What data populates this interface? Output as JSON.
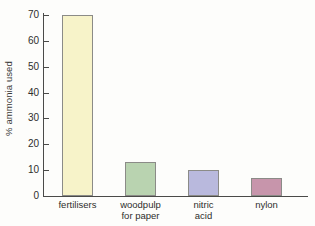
{
  "chart_data": {
    "type": "bar",
    "title": "",
    "xlabel": "",
    "ylabel": "% ammonia used",
    "categories": [
      "fertilisers",
      "woodpulp\nfor paper",
      "nitric\nacid",
      "nylon"
    ],
    "values": [
      70,
      13,
      10,
      7
    ],
    "ylim": [
      0,
      70
    ],
    "yticks": [
      0,
      10,
      20,
      30,
      40,
      50,
      60,
      70
    ],
    "ytick_labels": [
      "0",
      "10",
      "20",
      "30",
      "40",
      "50",
      "60",
      "70"
    ],
    "grid": false,
    "legend": null,
    "bar_colors": [
      "#f7f3c9",
      "#b9d3b0",
      "#b9b9dd",
      "#c795ab"
    ],
    "bar_border_color": "#8b8b87",
    "axis_color": "#4a4a48",
    "background_color": "#fdfdfb",
    "text_color": "#2e2e2c"
  },
  "figure": {
    "y_axis_title": "% ammonia used"
  }
}
